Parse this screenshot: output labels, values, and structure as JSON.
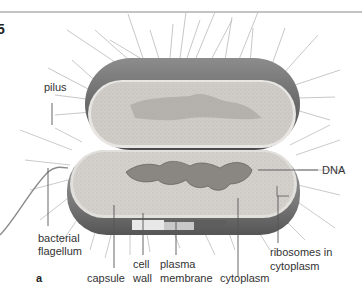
{
  "figure": {
    "panel_label": "a",
    "corner_glyph": "5"
  },
  "labels": {
    "pilus": "pilus",
    "dna": "DNA",
    "flagellum_1": "bacterial",
    "flagellum_2": "flagellum",
    "capsule": "capsule",
    "cell_wall_1": "cell",
    "cell_wall_2": "wall",
    "plasma_membrane_1": "plasma",
    "plasma_membrane_2": "membrane",
    "cytoplasm": "cytoplasm",
    "ribosomes_1": "ribosomes in",
    "ribosomes_2": "cytoplasm"
  },
  "colors": {
    "rule": "#8a8a8a",
    "capsule_dark": "#5c5c5c",
    "capsule_mid": "#9a9a9a",
    "cytoplasm": "#d6d3cf",
    "dna": "#7b7875",
    "pili": "#b8b8b8",
    "leader": "#555555"
  }
}
